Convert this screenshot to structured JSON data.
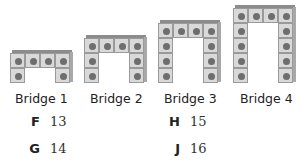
{
  "figure": {
    "bridges": [
      {
        "label": "Bridge 1",
        "width_cubes": 4,
        "height_cubes": 2,
        "total_cubes": 6
      },
      {
        "label": "Bridge 2",
        "width_cubes": 4,
        "height_cubes": 3,
        "total_cubes": 8
      },
      {
        "label": "Bridge 3",
        "width_cubes": 4,
        "height_cubes": 4,
        "total_cubes": 10
      },
      {
        "label": "Bridge 4",
        "width_cubes": 4,
        "height_cubes": 5,
        "total_cubes": 12
      }
    ],
    "colors": {
      "cube_face": "#d9d9d9",
      "cube_dot": "#6e6e6e",
      "cube_border": "#9a9a9a"
    }
  },
  "answer_choices": [
    {
      "letter": "F",
      "value": "13"
    },
    {
      "letter": "G",
      "value": "14"
    },
    {
      "letter": "H",
      "value": "15"
    },
    {
      "letter": "J",
      "value": "16"
    }
  ]
}
